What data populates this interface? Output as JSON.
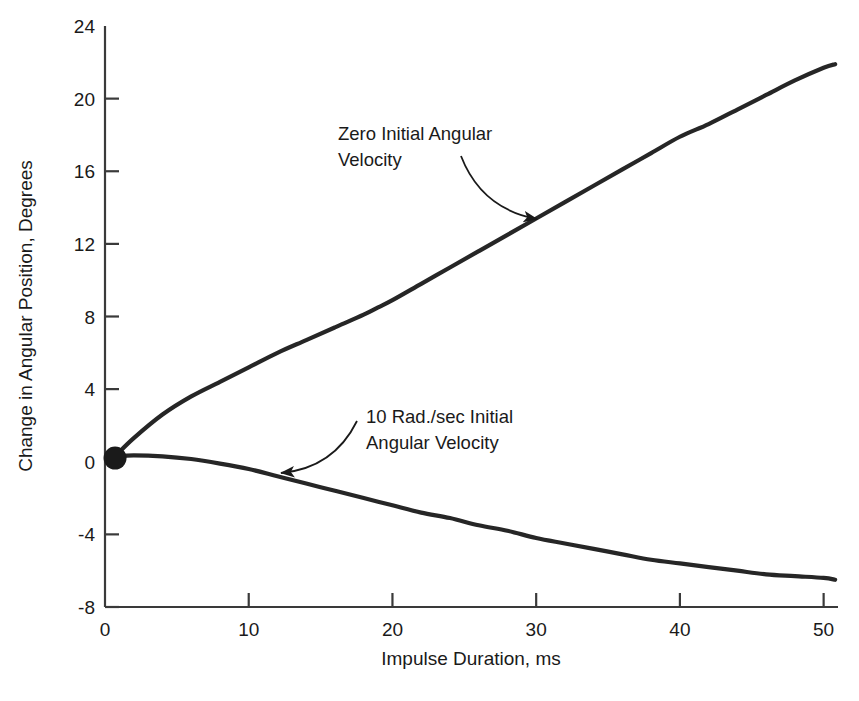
{
  "chart_data": {
    "type": "line",
    "title": "",
    "xlabel": "Impulse Duration, ms",
    "ylabel": "Change in Angular Position, Degrees",
    "xlim": [
      0,
      51
    ],
    "ylim": [
      -8,
      24
    ],
    "xticks": [
      0,
      10,
      20,
      30,
      40,
      50
    ],
    "xtick_labels": [
      "0",
      "10",
      "20",
      "30",
      "40",
      "50"
    ],
    "yticks": [
      -8,
      -4,
      0,
      4,
      8,
      12,
      16,
      20,
      24
    ],
    "ytick_labels": [
      "-8",
      "-4",
      "0",
      "4",
      "8",
      "12",
      "16",
      "20",
      "24"
    ],
    "grid": false,
    "legend": "none",
    "markers": [
      {
        "name": "origin-dot",
        "x": 0.7,
        "y": 0.2,
        "style": "filled-circle",
        "color": "#1a1a1a"
      }
    ],
    "series": [
      {
        "name": "Zero Initial Angular Velocity",
        "color": "#262626",
        "x": [
          0.7,
          2,
          4,
          6,
          8,
          10,
          12,
          14,
          16,
          18,
          19,
          20,
          22,
          24,
          26,
          28,
          30,
          32,
          34,
          36,
          38,
          40,
          42,
          44,
          46,
          48,
          50,
          50.8
        ],
        "values": [
          0.3,
          1.3,
          2.6,
          3.6,
          4.4,
          5.2,
          6.0,
          6.7,
          7.4,
          8.1,
          8.5,
          8.9,
          9.8,
          10.7,
          11.6,
          12.5,
          13.4,
          14.3,
          15.2,
          16.1,
          17.0,
          17.9,
          18.6,
          19.4,
          20.2,
          21.0,
          21.7,
          21.9
        ]
      },
      {
        "name": "10 Rad./sec Initial Angular Velocity",
        "color": "#262626",
        "x": [
          0.7,
          2,
          4,
          6,
          8,
          10,
          12,
          14,
          16,
          18,
          20,
          22,
          24,
          26,
          28,
          30,
          32,
          34,
          36,
          38,
          40,
          42,
          44,
          46,
          48,
          50,
          50.8
        ],
        "values": [
          0.3,
          0.35,
          0.3,
          0.15,
          -0.1,
          -0.4,
          -0.8,
          -1.2,
          -1.6,
          -2.0,
          -2.4,
          -2.8,
          -3.1,
          -3.5,
          -3.8,
          -4.2,
          -4.5,
          -4.8,
          -5.1,
          -5.4,
          -5.6,
          -5.8,
          -6.0,
          -6.2,
          -6.3,
          -6.4,
          -6.5
        ]
      }
    ],
    "annotations": [
      {
        "name": "zero-initial-angular-velocity",
        "lines": [
          "Zero Initial Angular",
          "Velocity"
        ],
        "text_x": 338,
        "text_y": 140,
        "arrow_from": {
          "x": 461,
          "y": 156
        },
        "arrow_to": {
          "x": 537,
          "y": 219
        }
      },
      {
        "name": "ten-rad-per-sec-initial-angular-velocity",
        "lines": [
          "10 Rad./sec Initial",
          "Angular Velocity"
        ],
        "text_x": 366,
        "text_y": 423,
        "arrow_from": {
          "x": 357,
          "y": 421
        },
        "arrow_to": {
          "x": 281,
          "y": 473
        }
      }
    ]
  },
  "colors": {
    "curve": "#262626",
    "axis": "#3a3a3a",
    "text": "#1a1a1a",
    "background": "#ffffff"
  }
}
